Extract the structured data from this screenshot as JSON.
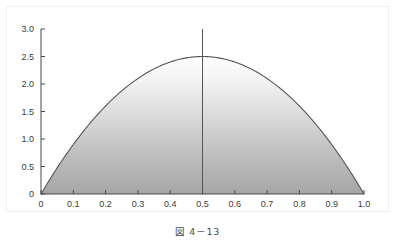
{
  "figure": {
    "caption": "図 4－13",
    "frame_color": "#f0f0f0",
    "background": "#ffffff"
  },
  "chart_data": {
    "type": "line",
    "title": "",
    "xlabel": "",
    "ylabel": "",
    "xlim": [
      0,
      1
    ],
    "ylim": [
      0,
      3
    ],
    "grid": false,
    "legend": null,
    "line_color": "#555555",
    "line_width": 1.1,
    "fill": {
      "type": "vertical-gradient",
      "top_color": "#ffffff",
      "bottom_color": "#a8a8a8",
      "description": "area under curve shaded with vertical white-to-gray gradient"
    },
    "xticks": [
      "0",
      "0.1",
      "0.2",
      "0.3",
      "0.4",
      "0.5",
      "0.6",
      "0.7",
      "0.8",
      "0.9",
      "1.0"
    ],
    "xtick_values": [
      0,
      0.1,
      0.2,
      0.3,
      0.4,
      0.5,
      0.6,
      0.7,
      0.8,
      0.9,
      1.0
    ],
    "yticks": [
      "0",
      "0.5",
      "1.0",
      "1.5",
      "2.0",
      "2.5",
      "3.0"
    ],
    "ytick_values": [
      0,
      0.5,
      1.0,
      1.5,
      2.0,
      2.5,
      3.0
    ],
    "tick_direction": "in",
    "axis_color": "#4a4a4a",
    "tick_label_color": "#3a3a3a",
    "tick_label_size": 9,
    "series": [
      {
        "name": "parabola",
        "equation": "y = 10x(1-x)",
        "x": [
          0.0,
          0.05,
          0.1,
          0.15,
          0.2,
          0.25,
          0.3,
          0.35,
          0.4,
          0.45,
          0.5,
          0.55,
          0.6,
          0.65,
          0.7,
          0.75,
          0.8,
          0.85,
          0.9,
          0.95,
          1.0
        ],
        "values": [
          0.0,
          0.475,
          0.9,
          1.275,
          1.6,
          1.875,
          2.1,
          2.275,
          2.4,
          2.475,
          2.5,
          2.475,
          2.4,
          2.275,
          2.1,
          1.875,
          1.6,
          1.275,
          0.9,
          0.475,
          0.0
        ]
      }
    ],
    "annotations": [
      {
        "type": "vertical-line",
        "name": "peak-marker",
        "x": 0.5,
        "y_from": 0,
        "y_to": 3.0,
        "color": "#555555",
        "width": 1
      }
    ],
    "markers": [
      {
        "name": "peak",
        "x": 0.5,
        "y": 2.5
      }
    ]
  }
}
